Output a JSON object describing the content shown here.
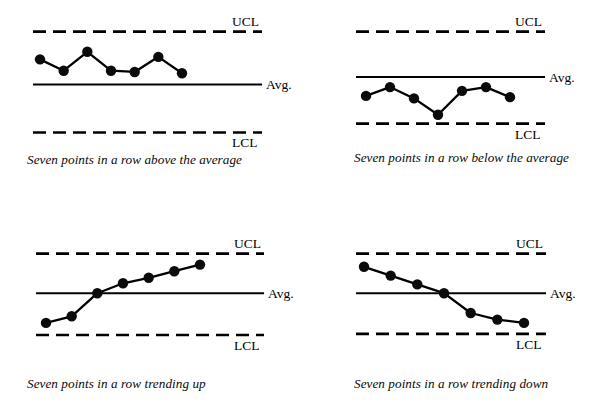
{
  "figure": {
    "marker_color": "#0b0b0b",
    "line_color": "#000000",
    "background": "#ffffff"
  },
  "labels": {
    "ucl": "UCL",
    "avg": "Avg.",
    "lcl": "LCL"
  },
  "chart_data": [
    {
      "type": "line",
      "title": "Seven points in a row above the average",
      "caption": "Seven points in a row above the average",
      "xlabel": "",
      "ylabel": "",
      "grid": false,
      "legend": "none",
      "ylim": [
        0,
        100
      ],
      "reference_lines": [
        {
          "name": "UCL",
          "label": "UCL",
          "value": 86,
          "style": "dashed"
        },
        {
          "name": "Avg",
          "label": "Avg.",
          "value": 44,
          "style": "solid"
        },
        {
          "name": "LCL",
          "label": "LCL",
          "value": 6,
          "style": "dashed"
        }
      ],
      "x": [
        1,
        2,
        3,
        4,
        5,
        6,
        7
      ],
      "values": [
        64,
        55,
        70,
        55,
        54,
        66,
        53
      ]
    },
    {
      "type": "line",
      "title": "Seven points in a row below the average",
      "caption": "Seven points in a row below the average",
      "xlabel": "",
      "ylabel": "",
      "grid": false,
      "legend": "none",
      "ylim": [
        0,
        100
      ],
      "reference_lines": [
        {
          "name": "UCL",
          "label": "UCL",
          "value": 86,
          "style": "dashed"
        },
        {
          "name": "Avg",
          "label": "Avg.",
          "value": 50,
          "style": "solid"
        },
        {
          "name": "LCL",
          "label": "LCL",
          "value": 13,
          "style": "dashed"
        }
      ],
      "x": [
        1,
        2,
        3,
        4,
        5,
        6,
        7
      ],
      "values": [
        35,
        42,
        33,
        20,
        39,
        42,
        34
      ]
    },
    {
      "type": "line",
      "title": "Seven points in a row trending up",
      "caption": "Seven points in a row trending up",
      "xlabel": "",
      "ylabel": "",
      "grid": false,
      "legend": "none",
      "ylim": [
        0,
        100
      ],
      "reference_lines": [
        {
          "name": "UCL",
          "label": "UCL",
          "value": 84,
          "style": "dashed"
        },
        {
          "name": "Avg",
          "label": "Avg.",
          "value": 48,
          "style": "solid"
        },
        {
          "name": "LCL",
          "label": "LCL",
          "value": 10,
          "style": "dashed"
        }
      ],
      "x": [
        1,
        2,
        3,
        4,
        5,
        6,
        7
      ],
      "values": [
        21,
        27,
        48,
        57,
        62,
        68,
        74
      ]
    },
    {
      "type": "line",
      "title": "Seven points in a row trending down",
      "caption": "Seven points in a row trending down",
      "xlabel": "",
      "ylabel": "",
      "grid": false,
      "legend": "none",
      "ylim": [
        0,
        100
      ],
      "reference_lines": [
        {
          "name": "UCL",
          "label": "UCL",
          "value": 84,
          "style": "dashed"
        },
        {
          "name": "Avg",
          "label": "Avg.",
          "value": 48,
          "style": "solid"
        },
        {
          "name": "LCL",
          "label": "LCL",
          "value": 11,
          "style": "dashed"
        }
      ],
      "x": [
        1,
        2,
        3,
        4,
        5,
        6,
        7
      ],
      "values": [
        72,
        64,
        56,
        48,
        30,
        24,
        21
      ]
    }
  ]
}
